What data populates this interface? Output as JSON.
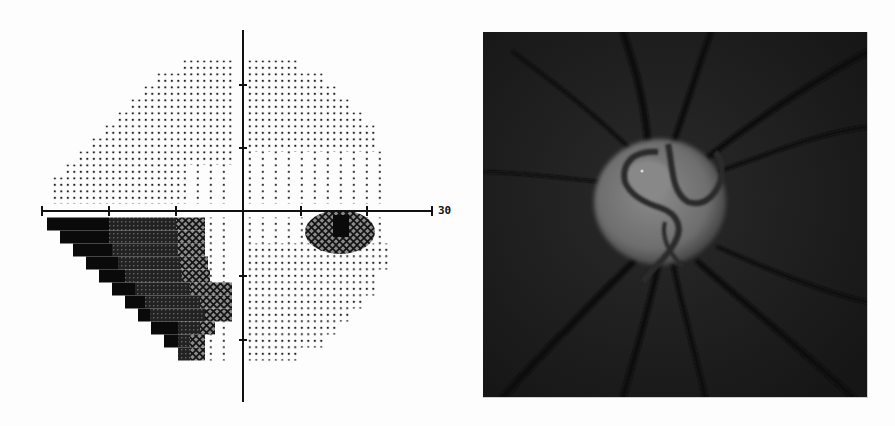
{
  "figure": {
    "left_panel": {
      "title": "Visual field greyscale plot",
      "axis_label_right": "30",
      "axis": {
        "center_x": 243,
        "center_y": 211,
        "x_min_px": 42,
        "x_max_px": 432,
        "y_min_px": 30,
        "y_max_px": 402,
        "h_ticks_px": [
          109,
          176,
          301,
          367
        ],
        "v_ticks_px": [
          85,
          148,
          276,
          340
        ]
      },
      "grid": {
        "row_height": 13,
        "col_width": 6.5
      },
      "upper_left_rows": [
        {
          "y": 67,
          "x0": 183,
          "x1": 235
        },
        {
          "y": 80,
          "x0": 157,
          "x1": 235
        },
        {
          "y": 93,
          "x0": 144,
          "x1": 235
        },
        {
          "y": 106,
          "x0": 131,
          "x1": 235
        },
        {
          "y": 119,
          "x0": 118,
          "x1": 235
        },
        {
          "y": 132,
          "x0": 105,
          "x1": 235
        },
        {
          "y": 145,
          "x0": 92,
          "x1": 235
        },
        {
          "y": 158,
          "x0": 79,
          "x1": 235
        },
        {
          "y": 171,
          "x0": 66,
          "x1": 235
        },
        {
          "y": 184,
          "x0": 53,
          "x1": 235
        },
        {
          "y": 197,
          "x0": 53,
          "x1": 235
        }
      ],
      "upper_right_rows": [
        {
          "y": 67,
          "x0": 248,
          "x1": 297
        },
        {
          "y": 80,
          "x0": 248,
          "x1": 323
        },
        {
          "y": 93,
          "x0": 248,
          "x1": 336
        },
        {
          "y": 106,
          "x0": 248,
          "x1": 349
        },
        {
          "y": 119,
          "x0": 248,
          "x1": 362
        },
        {
          "y": 132,
          "x0": 248,
          "x1": 375
        },
        {
          "y": 145,
          "x0": 248,
          "x1": 375
        },
        {
          "y": 158,
          "x0": 248,
          "x1": 388
        },
        {
          "y": 171,
          "x0": 248,
          "x1": 388
        },
        {
          "y": 184,
          "x0": 248,
          "x1": 388
        },
        {
          "y": 197,
          "x0": 248,
          "x1": 388
        }
      ],
      "lower_right_rows": [
        {
          "y": 224,
          "x0": 248,
          "x1": 388
        },
        {
          "y": 237,
          "x0": 248,
          "x1": 388
        },
        {
          "y": 250,
          "x0": 248,
          "x1": 388
        },
        {
          "y": 263,
          "x0": 248,
          "x1": 388
        },
        {
          "y": 276,
          "x0": 248,
          "x1": 375
        },
        {
          "y": 289,
          "x0": 248,
          "x1": 375
        },
        {
          "y": 302,
          "x0": 248,
          "x1": 362
        },
        {
          "y": 315,
          "x0": 248,
          "x1": 349
        },
        {
          "y": 328,
          "x0": 248,
          "x1": 336
        },
        {
          "y": 341,
          "x0": 248,
          "x1": 323
        },
        {
          "y": 354,
          "x0": 248,
          "x1": 297
        }
      ],
      "lower_left_rows": [
        {
          "y": 224,
          "x0": 47,
          "black_end": 109,
          "dense_end": 176,
          "hatch_end": 205,
          "x1": 235
        },
        {
          "y": 237,
          "x0": 60,
          "black_end": 109,
          "dense_end": 178,
          "hatch_end": 205,
          "x1": 235
        },
        {
          "y": 250,
          "x0": 73,
          "black_end": 112,
          "dense_end": 178,
          "hatch_end": 205,
          "x1": 235
        },
        {
          "y": 263,
          "x0": 86,
          "black_end": 118,
          "dense_end": 180,
          "hatch_end": 208,
          "x1": 235
        },
        {
          "y": 276,
          "x0": 99,
          "black_end": 125,
          "dense_end": 182,
          "hatch_end": 210,
          "x1": 235
        },
        {
          "y": 289,
          "x0": 112,
          "black_end": 135,
          "dense_end": 190,
          "hatch_end": 232,
          "x1": 235
        },
        {
          "y": 302,
          "x0": 125,
          "black_end": 145,
          "dense_end": 200,
          "hatch_end": 232,
          "x1": 235
        },
        {
          "y": 315,
          "x0": 138,
          "black_end": 150,
          "dense_end": 205,
          "hatch_end": 232,
          "x1": 235
        },
        {
          "y": 328,
          "x0": 151,
          "black_end": 178,
          "dense_end": 200,
          "hatch_end": 215,
          "x1": 235
        },
        {
          "y": 341,
          "x0": 164,
          "black_end": 178,
          "dense_end": 190,
          "hatch_end": 205,
          "x1": 235
        },
        {
          "y": 354,
          "x0": 178,
          "black_end": 178,
          "dense_end": 190,
          "hatch_end": 205,
          "x1": 235
        }
      ],
      "blind_spot": {
        "cx": 340,
        "cy": 232,
        "rx": 35,
        "ry": 22,
        "core": {
          "x": 333,
          "y": 215,
          "w": 16,
          "h": 22
        }
      }
    },
    "right_panel": {
      "title": "Optic disc fundus photograph",
      "background": "#1e1e1e",
      "disc": {
        "cx": 177,
        "cy": 170,
        "rx": 66,
        "ry": 63,
        "color": "#707070"
      },
      "cup": {
        "cx": 165,
        "cy": 148,
        "rx": 24,
        "ry": 20,
        "color": "#858585"
      }
    }
  }
}
